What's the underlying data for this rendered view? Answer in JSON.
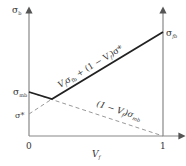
{
  "diagram": {
    "type": "rule-of-mixtures strength diagram",
    "y_axis_label": "σ",
    "y_axis_label_sub": "b",
    "x_axis_label": "V",
    "x_axis_label_sub": "f",
    "x_tick_0": "0",
    "x_tick_1": "1",
    "left_labels": {
      "sigma_mb": "σ",
      "sigma_mb_sub": "mb",
      "sigma_star": "σ*"
    },
    "right_label": "σ",
    "right_label_sub": "fb",
    "solid_line_label": "V_fσ_fb + (1 − V_f)σ*",
    "solid_line_label_parts": {
      "v": "V",
      "f": "f",
      "sigma": "σ",
      "fb": "fb",
      "mid": " + (1 − V",
      "f2": "f",
      "end": ")σ*"
    },
    "dashed_line_label_parts": {
      "start": "(1 − V",
      "f": "f",
      "mid": ")σ",
      "mb": "mb"
    },
    "colors": {
      "axis": "#888888",
      "solid": "#222222",
      "dashed": "#999999"
    }
  }
}
